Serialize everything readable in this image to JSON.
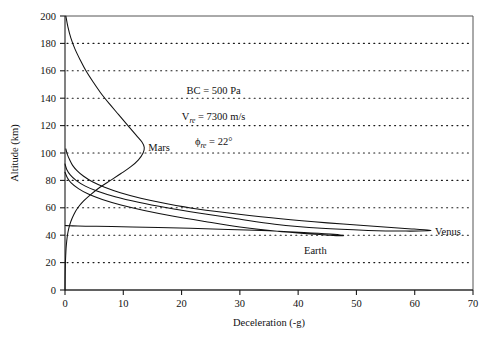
{
  "chart_data": {
    "type": "line",
    "title": "",
    "xlabel": "Deceleration (-g)",
    "ylabel": "Altitude (km)",
    "xlim": [
      0,
      70
    ],
    "ylim": [
      0,
      200
    ],
    "xticks": [
      0,
      10,
      20,
      30,
      40,
      50,
      60,
      70
    ],
    "yticks": [
      0,
      20,
      40,
      60,
      80,
      100,
      120,
      140,
      160,
      180,
      200
    ],
    "grid": "horizontal-dotted",
    "legend": "inline-labels",
    "annotations": [
      {
        "id": "bc",
        "pre": "BC = 500 Pa",
        "sub": "",
        "post": ""
      },
      {
        "id": "vre",
        "pre": "V",
        "sub": "re",
        "post": " = 7300 m/s"
      },
      {
        "id": "phire",
        "pre": "ϕ",
        "sub": "re",
        "post": " = 22°"
      }
    ],
    "series": [
      {
        "name": "Mars",
        "label": "Mars",
        "label_x": 14.3,
        "label_y": 104,
        "points": [
          [
            0.15,
            200
          ],
          [
            0.5,
            192
          ],
          [
            1.0,
            184
          ],
          [
            1.7,
            176
          ],
          [
            2.6,
            168
          ],
          [
            3.6,
            160
          ],
          [
            4.8,
            152
          ],
          [
            6.1,
            144
          ],
          [
            7.6,
            136
          ],
          [
            9.2,
            128
          ],
          [
            10.8,
            120
          ],
          [
            12.2,
            113
          ],
          [
            13.2,
            108
          ],
          [
            13.6,
            104
          ],
          [
            13.4,
            100
          ],
          [
            12.6,
            95
          ],
          [
            11.3,
            90
          ],
          [
            9.6,
            85
          ],
          [
            7.8,
            80
          ],
          [
            6.0,
            75
          ],
          [
            4.5,
            70
          ],
          [
            3.2,
            65
          ],
          [
            2.2,
            60
          ],
          [
            1.5,
            55
          ],
          [
            1.0,
            50
          ],
          [
            0.65,
            45
          ],
          [
            0.42,
            40
          ],
          [
            0.28,
            35
          ],
          [
            0.18,
            30
          ],
          [
            0.12,
            25
          ],
          [
            0.07,
            20
          ],
          [
            0.04,
            15
          ],
          [
            0.02,
            10
          ],
          [
            0.01,
            5
          ],
          [
            0.0,
            0
          ]
        ]
      },
      {
        "name": "Venus",
        "label": "Venus",
        "label_x": 63.5,
        "label_y": 43,
        "points": [
          [
            0.0,
            92
          ],
          [
            0.3,
            88
          ],
          [
            0.9,
            84
          ],
          [
            1.9,
            80
          ],
          [
            3.4,
            76
          ],
          [
            5.6,
            72
          ],
          [
            8.6,
            68
          ],
          [
            12.6,
            64
          ],
          [
            17.5,
            60
          ],
          [
            23.2,
            56
          ],
          [
            29.5,
            52
          ],
          [
            36.0,
            48
          ],
          [
            44.0,
            45
          ],
          [
            52.0,
            43.5
          ],
          [
            58.5,
            43
          ],
          [
            62.2,
            43.2
          ],
          [
            62.5,
            43.6
          ],
          [
            59.5,
            44.6
          ],
          [
            53.0,
            46.5
          ],
          [
            45.0,
            49
          ],
          [
            37.0,
            52
          ],
          [
            29.5,
            55.5
          ],
          [
            23.0,
            59
          ],
          [
            17.5,
            63
          ],
          [
            13.0,
            67
          ],
          [
            9.5,
            71
          ],
          [
            6.8,
            75
          ],
          [
            4.7,
            79
          ],
          [
            3.2,
            83
          ],
          [
            2.1,
            87
          ],
          [
            1.3,
            91
          ],
          [
            0.8,
            95
          ],
          [
            0.4,
            99
          ],
          [
            0.15,
            103
          ]
        ]
      },
      {
        "name": "Earth",
        "label": "Earth",
        "label_x": 41,
        "label_y": 29,
        "points": [
          [
            0.0,
            86
          ],
          [
            0.4,
            82
          ],
          [
            1.1,
            78
          ],
          [
            2.3,
            74
          ],
          [
            4.0,
            70
          ],
          [
            6.4,
            66
          ],
          [
            9.6,
            62
          ],
          [
            13.6,
            58
          ],
          [
            18.4,
            54
          ],
          [
            24.0,
            50
          ],
          [
            30.0,
            46
          ],
          [
            36.0,
            43
          ],
          [
            41.5,
            41
          ],
          [
            45.5,
            40
          ],
          [
            47.4,
            39.6
          ],
          [
            47.6,
            39.9
          ],
          [
            45.5,
            40.8
          ],
          [
            41.0,
            42
          ],
          [
            35.0,
            43.2
          ],
          [
            28.0,
            44.2
          ],
          [
            21.5,
            45.0
          ],
          [
            16.0,
            45.6
          ],
          [
            11.5,
            46.0
          ],
          [
            8.0,
            46.3
          ],
          [
            5.4,
            46.5
          ],
          [
            3.5,
            46.6
          ],
          [
            2.2,
            46.7
          ],
          [
            1.3,
            46.8
          ],
          [
            0.7,
            46.9
          ],
          [
            0.3,
            47.0
          ],
          [
            0.05,
            47.1
          ]
        ]
      }
    ]
  }
}
